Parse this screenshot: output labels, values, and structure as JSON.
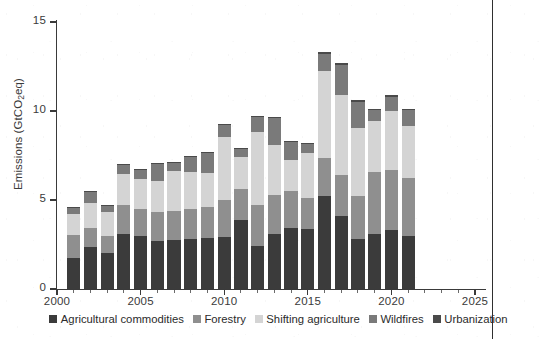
{
  "figure": {
    "background_color": "#ffffff",
    "page_edge_line_color": "#2f2f2f"
  },
  "axes": {
    "y_label": "Emissions (GtCO",
    "y_label_sub": "2",
    "y_label_tail": "eq)",
    "y_ticks": [
      "0",
      "5",
      "10",
      "15"
    ],
    "x_ticks": [
      "2000",
      "2005",
      "2010",
      "2015",
      "2020",
      "2025"
    ]
  },
  "legend": {
    "items": [
      {
        "label": "Agricultural commodities",
        "color": "#3b3b3b"
      },
      {
        "label": "Forestry",
        "color": "#8f8f8f"
      },
      {
        "label": "Shifting agriculture",
        "color": "#d4d4d4"
      },
      {
        "label": "Wildfires",
        "color": "#7a7a7a"
      },
      {
        "label": "Urbanization",
        "color": "#4a4a4a"
      }
    ]
  },
  "chart_data": {
    "type": "bar",
    "subtype": "stacked",
    "title": "",
    "xlabel": "",
    "ylabel": "Emissions (GtCO2eq)",
    "xlim": [
      2000,
      2025
    ],
    "ylim": [
      0,
      15
    ],
    "ytick_values": [
      0,
      5,
      10,
      15
    ],
    "xtick_values": [
      2000,
      2005,
      2010,
      2015,
      2020,
      2025
    ],
    "grid": false,
    "legend_position": "bottom",
    "categories": [
      2001,
      2002,
      2003,
      2004,
      2005,
      2006,
      2007,
      2008,
      2009,
      2010,
      2011,
      2012,
      2013,
      2014,
      2015,
      2016,
      2017,
      2018,
      2019,
      2020,
      2021
    ],
    "series": [
      {
        "name": "Agricultural commodities",
        "color": "#3b3b3b",
        "values": [
          1.75,
          2.35,
          2.0,
          3.1,
          3.0,
          2.7,
          2.75,
          2.8,
          2.85,
          2.9,
          3.9,
          2.4,
          3.1,
          3.4,
          3.35,
          5.25,
          4.1,
          2.8,
          3.1,
          3.3,
          3.0
        ]
      },
      {
        "name": "Forestry",
        "color": "#8f8f8f",
        "values": [
          1.3,
          1.05,
          1.0,
          1.6,
          1.5,
          1.6,
          1.65,
          1.7,
          1.75,
          2.1,
          1.7,
          2.3,
          2.2,
          2.1,
          1.75,
          2.1,
          2.3,
          2.4,
          3.5,
          3.4,
          3.25
        ]
      },
      {
        "name": "Shifting agriculture",
        "color": "#d4d4d4",
        "values": [
          1.15,
          1.45,
          1.35,
          1.75,
          1.7,
          1.75,
          2.25,
          2.1,
          1.9,
          3.55,
          1.8,
          4.1,
          2.8,
          1.75,
          2.55,
          4.9,
          4.5,
          3.85,
          2.85,
          3.3,
          2.9
        ]
      },
      {
        "name": "Wildfires",
        "color": "#7a7a7a",
        "values": [
          0.35,
          0.6,
          0.3,
          0.5,
          0.5,
          1.0,
          0.45,
          0.8,
          1.15,
          0.65,
          0.5,
          0.85,
          1.5,
          1.0,
          0.5,
          0.95,
          1.7,
          1.45,
          0.6,
          0.8,
          0.9
        ]
      },
      {
        "name": "Urbanization",
        "color": "#4a4a4a",
        "values": [
          0.05,
          0.05,
          0.05,
          0.05,
          0.05,
          0.05,
          0.05,
          0.05,
          0.05,
          0.05,
          0.05,
          0.05,
          0.05,
          0.05,
          0.05,
          0.1,
          0.1,
          0.1,
          0.05,
          0.1,
          0.05
        ]
      }
    ],
    "totals": [
      4.6,
      5.5,
      4.7,
      7.0,
      6.75,
      7.1,
      7.15,
      7.45,
      7.7,
      9.25,
      7.95,
      9.7,
      9.65,
      8.3,
      8.2,
      13.3,
      12.7,
      10.6,
      10.1,
      10.9,
      10.1
    ]
  }
}
